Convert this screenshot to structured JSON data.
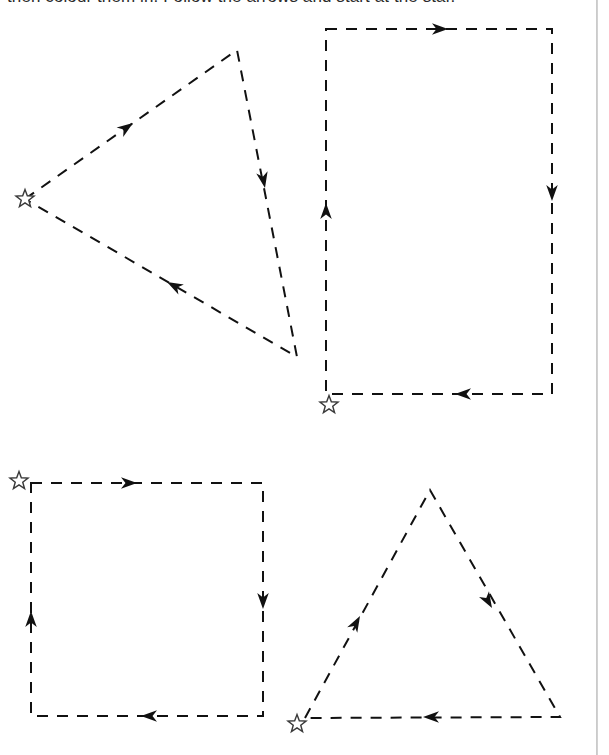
{
  "page": {
    "background_color": "#ffffff",
    "ink_color": "#111111",
    "width": 609,
    "height": 755
  },
  "instruction": {
    "text": "then colour them in. Follow the arrows and start at the star.",
    "note": "Line is cropped at the top edge of the page; only the lower pixels of the text are visible."
  },
  "legend": {
    "star_meaning": "start point",
    "arrow_meaning": "direction of travel",
    "line_style": "dashed"
  },
  "shapes": [
    {
      "id": "shape-1",
      "name": "triangle-top-left",
      "type": "triangle",
      "label": "Triangle (top left)",
      "direction": "clockwise",
      "start_marker": "star",
      "start_point": [
        25,
        199
      ],
      "vertices": [
        [
          25,
          199
        ],
        [
          237,
          50
        ],
        [
          297,
          357
        ]
      ],
      "arrows": [
        {
          "name": "arrow-upper-left-edge",
          "at": [
            133,
            123
          ],
          "angle": -35
        },
        {
          "name": "arrow-right-edge",
          "at": [
            265,
            188
          ],
          "angle": 79
        },
        {
          "name": "arrow-lower-edge",
          "at": [
            167,
            282
          ],
          "angle": 208
        }
      ]
    },
    {
      "id": "shape-2",
      "name": "rectangle-top-right",
      "type": "rectangle",
      "label": "Rectangle (top right)",
      "direction": "clockwise",
      "start_marker": "star",
      "start_point": [
        329,
        405
      ],
      "vertices": [
        [
          326,
          29
        ],
        [
          552,
          29
        ],
        [
          552,
          394
        ],
        [
          326,
          394
        ]
      ],
      "arrows": [
        {
          "name": "arrow-top-edge",
          "at": [
            448,
            29
          ],
          "angle": 0
        },
        {
          "name": "arrow-right-edge",
          "at": [
            552,
            201
          ],
          "angle": 90
        },
        {
          "name": "arrow-bottom-edge",
          "at": [
            455,
            394
          ],
          "angle": 180
        },
        {
          "name": "arrow-left-edge",
          "at": [
            326,
            203
          ],
          "angle": 270
        }
      ]
    },
    {
      "id": "shape-3",
      "name": "square-bottom-left",
      "type": "square",
      "label": "Square (bottom left)",
      "direction": "clockwise",
      "start_marker": "star",
      "start_point": [
        19,
        481
      ],
      "vertices": [
        [
          31,
          483
        ],
        [
          263,
          483
        ],
        [
          263,
          716
        ],
        [
          31,
          716
        ]
      ],
      "arrows": [
        {
          "name": "arrow-top-edge",
          "at": [
            137,
            483
          ],
          "angle": 0
        },
        {
          "name": "arrow-right-edge",
          "at": [
            263,
            609
          ],
          "angle": 90
        },
        {
          "name": "arrow-bottom-edge",
          "at": [
            141,
            716
          ],
          "angle": 180
        },
        {
          "name": "arrow-left-edge",
          "at": [
            31,
            611
          ],
          "angle": 270
        }
      ]
    },
    {
      "id": "shape-4",
      "name": "triangle-bottom-right",
      "type": "triangle",
      "label": "Triangle (bottom right)",
      "direction": "clockwise",
      "start_marker": "star",
      "start_point": [
        297,
        724
      ],
      "vertices": [
        [
          305,
          718
        ],
        [
          430,
          490
        ],
        [
          560,
          717
        ]
      ],
      "arrows": [
        {
          "name": "arrow-left-edge",
          "at": [
            360,
            616
          ],
          "angle": -61
        },
        {
          "name": "arrow-right-edge",
          "at": [
            492,
            608
          ],
          "angle": 60
        },
        {
          "name": "arrow-bottom-edge",
          "at": [
            423,
            717
          ],
          "angle": 180
        }
      ]
    }
  ],
  "markers": {
    "star_count": 4,
    "arrow_count": 14,
    "star_size": 19,
    "arrow_length": 16
  }
}
